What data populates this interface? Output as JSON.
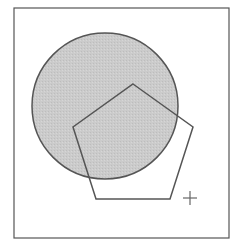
{
  "diagram": {
    "frame": {
      "x": 14,
      "y": 8,
      "width": 215,
      "height": 230,
      "stroke": "#555555"
    },
    "circle": {
      "cx": 105,
      "cy": 106,
      "r": 73,
      "fill": "#c9c9c9",
      "stroke": "#555555"
    },
    "pentagon": {
      "points": "133,84 193,127 170,199 96,199 73,127",
      "stroke": "#555555"
    },
    "plus_marker": {
      "cx": 190,
      "cy": 198,
      "size": 7,
      "stroke": "#666666"
    }
  }
}
